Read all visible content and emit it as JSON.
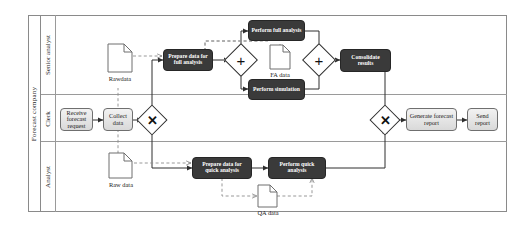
{
  "diagram": {
    "type": "bpmn-collaboration",
    "pool": {
      "name": "Forecast company"
    },
    "lanes": [
      {
        "id": "senior-analyst",
        "name": "Senior analyst"
      },
      {
        "id": "clerk",
        "name": "Clerk"
      },
      {
        "id": "analyst",
        "name": "Analyst"
      }
    ],
    "tasks": [
      {
        "id": "receive-forecast-request",
        "label": "Receive forecast request",
        "lane": "clerk",
        "style": "light"
      },
      {
        "id": "collect-data",
        "label": "Collect data",
        "lane": "clerk",
        "style": "light"
      },
      {
        "id": "prepare-data-full",
        "label": "Prepare data for full analysis",
        "lane": "senior-analyst",
        "style": "dark"
      },
      {
        "id": "perform-full-analysis",
        "label": "Perform full analysis",
        "lane": "senior-analyst",
        "style": "dark"
      },
      {
        "id": "perform-simulation",
        "label": "Perform simulation",
        "lane": "senior-analyst",
        "style": "dark"
      },
      {
        "id": "consolidate-results",
        "label": "Consolidate results",
        "lane": "senior-analyst",
        "style": "dark"
      },
      {
        "id": "prepare-data-quick",
        "label": "Prepare data for quick analysis",
        "lane": "analyst",
        "style": "dark"
      },
      {
        "id": "perform-quick-analysis",
        "label": "Perform quick analysis",
        "lane": "analyst",
        "style": "dark"
      },
      {
        "id": "generate-forecast-report",
        "label": "Generate forecast report",
        "lane": "clerk",
        "style": "light"
      },
      {
        "id": "send-report",
        "label": "Send report",
        "lane": "clerk",
        "style": "light"
      }
    ],
    "gateways": [
      {
        "id": "split-xor",
        "kind": "exclusive",
        "symbol": "✕",
        "lane": "clerk"
      },
      {
        "id": "split-parallel",
        "kind": "parallel",
        "symbol": "+",
        "lane": "senior-analyst"
      },
      {
        "id": "join-parallel",
        "kind": "parallel",
        "symbol": "+",
        "lane": "senior-analyst"
      },
      {
        "id": "join-xor",
        "kind": "exclusive",
        "symbol": "✕",
        "lane": "clerk"
      }
    ],
    "data_objects": [
      {
        "id": "rawdata",
        "label": "Rawdata",
        "lane": "senior-analyst"
      },
      {
        "id": "fa-data",
        "label": "FA data",
        "lane": "senior-analyst"
      },
      {
        "id": "raw-data",
        "label": "Raw data",
        "lane": "analyst"
      },
      {
        "id": "qa-data",
        "label": "QA data",
        "lane": "analyst"
      }
    ],
    "colors": {
      "pool_border": "#8a8a8a",
      "lane_border": "#9a9a9a",
      "dark_task_fill": "#3a3a3a",
      "light_task_fill": "#e8e8e8",
      "flow_line": "#3d3d3d",
      "association_line": "#8d8d8d",
      "canvas_background": "#ffffff"
    }
  }
}
